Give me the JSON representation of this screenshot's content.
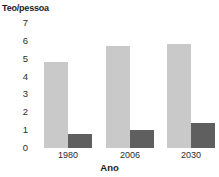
{
  "chart_data": {
    "type": "bar",
    "title": "",
    "subtitle": "",
    "xlabel": "Ano",
    "ylabel": "Teo/pessoa",
    "categories": [
      "1980",
      "2006",
      "2030"
    ],
    "series": [
      {
        "name": "light-series",
        "values": [
          4.8,
          5.7,
          5.8
        ],
        "color": "#c9c9c9"
      },
      {
        "name": "dark-series",
        "values": [
          0.8,
          1.0,
          1.4
        ],
        "color": "#5f5f5f"
      }
    ],
    "ylim": [
      0,
      7
    ],
    "yticks": [
      "0",
      "1",
      "2",
      "3",
      "4",
      "5",
      "6",
      "7"
    ],
    "ytick_values": [
      0,
      1,
      2,
      3,
      4,
      5,
      6,
      7
    ],
    "grid": false,
    "legend": false,
    "legend_position": "none",
    "annotations": []
  },
  "axes": {
    "y_title": "Teo/pessoa",
    "x_title": "Ano"
  }
}
